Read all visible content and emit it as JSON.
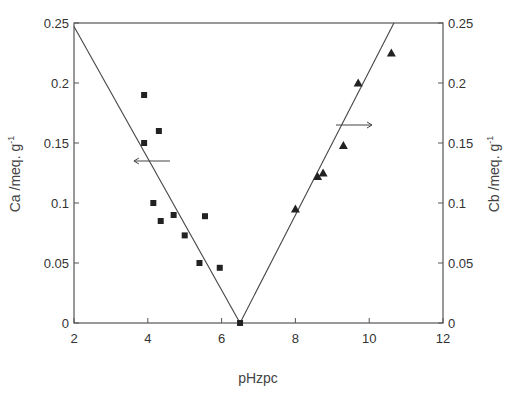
{
  "chart_data": {
    "type": "scatter",
    "title": "",
    "xlabel": "pHzpc",
    "ylabel": "Ca /meq. g-1",
    "ylabel_right": "Cb /meq. g-1",
    "xlim": [
      2,
      12
    ],
    "ylim": [
      0,
      0.25
    ],
    "ylim_right": [
      0,
      0.25
    ],
    "x_ticks": [
      "2",
      "4",
      "6",
      "8",
      "10",
      "12"
    ],
    "y_ticks": [
      "0",
      "0.05",
      "0.1",
      "0.15",
      "0.2",
      "0.25"
    ],
    "y_ticks_right": [
      "0",
      "0.05",
      "0.1",
      "0.15",
      "0.2",
      "0.25"
    ],
    "grid": false,
    "legend": "none",
    "series": [
      {
        "name": "Ca (acidic sites)",
        "marker": "square",
        "axis": "left",
        "points": [
          {
            "x": 3.9,
            "y": 0.19
          },
          {
            "x": 3.9,
            "y": 0.15
          },
          {
            "x": 4.3,
            "y": 0.16
          },
          {
            "x": 4.15,
            "y": 0.1
          },
          {
            "x": 4.35,
            "y": 0.085
          },
          {
            "x": 4.7,
            "y": 0.09
          },
          {
            "x": 5.0,
            "y": 0.073
          },
          {
            "x": 5.4,
            "y": 0.05
          },
          {
            "x": 5.55,
            "y": 0.089
          },
          {
            "x": 5.95,
            "y": 0.046
          },
          {
            "x": 6.5,
            "y": 0.0
          }
        ]
      },
      {
        "name": "Cb (basic sites)",
        "marker": "triangle",
        "axis": "right",
        "points": [
          {
            "x": 8.0,
            "y": 0.095
          },
          {
            "x": 8.6,
            "y": 0.122
          },
          {
            "x": 8.75,
            "y": 0.125
          },
          {
            "x": 9.3,
            "y": 0.148
          },
          {
            "x": 9.7,
            "y": 0.2
          },
          {
            "x": 10.6,
            "y": 0.225
          }
        ]
      }
    ],
    "fit_lines": [
      {
        "name": "Ca fit",
        "from": {
          "x": 2.0,
          "y": 0.247
        },
        "to": {
          "x": 6.5,
          "y": 0.0
        }
      },
      {
        "name": "Cb fit",
        "from": {
          "x": 6.5,
          "y": 0.0
        },
        "to": {
          "x": 10.67,
          "y": 0.25
        }
      }
    ],
    "annotations": [
      {
        "type": "arrow",
        "direction": "left",
        "meaning": "Ca series uses left axis",
        "at": {
          "x": 4.6,
          "y": 0.135
        }
      },
      {
        "type": "arrow",
        "direction": "right",
        "meaning": "Cb series uses right axis",
        "at": {
          "x": 9.1,
          "y": 0.165
        }
      }
    ]
  }
}
